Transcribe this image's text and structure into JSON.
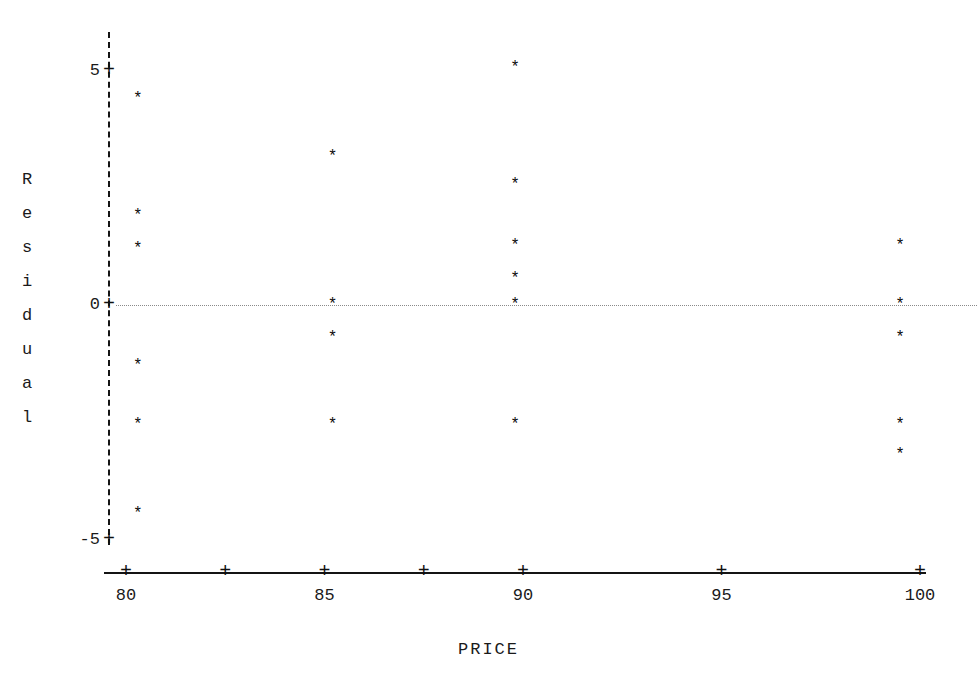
{
  "chart_data": {
    "type": "scatter",
    "title": "",
    "xlabel": "PRICE",
    "ylabel": "Residual",
    "xlim": [
      79.3,
      100.5
    ],
    "ylim": [
      -5.6,
      5.6
    ],
    "grid": false,
    "legend": null,
    "zero_reference_line": {
      "value": 0,
      "style": "dotted"
    },
    "marker": "*",
    "x_ticks": [
      80,
      82.5,
      85,
      87.5,
      90,
      95,
      100
    ],
    "x_tick_labels": [
      "80",
      "",
      "85",
      "",
      "90",
      "95",
      "100"
    ],
    "y_ticks": [
      5,
      0,
      -5
    ],
    "y_tick_labels": [
      "5",
      "0",
      "-5"
    ],
    "points": [
      {
        "x": 80.3,
        "y": 4.4
      },
      {
        "x": 80.3,
        "y": 1.9
      },
      {
        "x": 80.3,
        "y": 1.2
      },
      {
        "x": 80.3,
        "y": -1.3
      },
      {
        "x": 80.3,
        "y": -2.55
      },
      {
        "x": 80.3,
        "y": -4.45
      },
      {
        "x": 85.2,
        "y": 3.15
      },
      {
        "x": 85.2,
        "y": 0.0
      },
      {
        "x": 85.2,
        "y": -0.7
      },
      {
        "x": 85.2,
        "y": -2.55
      },
      {
        "x": 89.8,
        "y": 5.05
      },
      {
        "x": 89.8,
        "y": 2.55
      },
      {
        "x": 89.8,
        "y": 1.25
      },
      {
        "x": 89.8,
        "y": 0.55
      },
      {
        "x": 89.8,
        "y": 0.0
      },
      {
        "x": 89.8,
        "y": -2.55
      },
      {
        "x": 99.5,
        "y": 1.25
      },
      {
        "x": 99.5,
        "y": 0.0
      },
      {
        "x": 99.5,
        "y": -0.7
      },
      {
        "x": 99.5,
        "y": -2.55
      },
      {
        "x": 99.5,
        "y": -3.2
      }
    ]
  },
  "axis": {
    "y_title_chars": [
      "R",
      "e",
      "s",
      "i",
      "d",
      "u",
      "a",
      "l"
    ],
    "x_title": "PRICE",
    "tick_glyph": "+",
    "marker_glyph": "*"
  },
  "colors": {
    "background": "#ffffff",
    "axis": "#141414",
    "text": "#1a1a1a",
    "marker": "#0b0b0b",
    "zero_line": "#8a8a8a"
  }
}
